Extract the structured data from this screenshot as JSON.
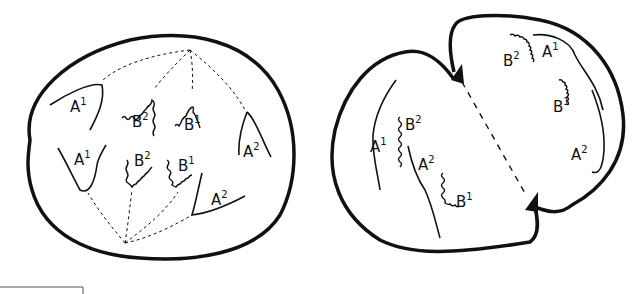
{
  "diagram": {
    "left_cell": {
      "stage": "metaphase",
      "labels": [
        {
          "id": "a1-top",
          "base": "A",
          "sup": "1",
          "x": 70,
          "y": 112
        },
        {
          "id": "b2-top",
          "base": "B",
          "sup": "2",
          "x": 132,
          "y": 127
        },
        {
          "id": "b1-top",
          "base": "B",
          "sup": "1",
          "x": 184,
          "y": 130
        },
        {
          "id": "a2-right",
          "base": "A",
          "sup": "2",
          "x": 243,
          "y": 157
        },
        {
          "id": "a1-bottom",
          "base": "A",
          "sup": "1",
          "x": 74,
          "y": 165
        },
        {
          "id": "b2-bottom",
          "base": "B",
          "sup": "2",
          "x": 134,
          "y": 166
        },
        {
          "id": "b1-bottom",
          "base": "B",
          "sup": "1",
          "x": 178,
          "y": 171
        },
        {
          "id": "a2-bottom",
          "base": "A",
          "sup": "2",
          "x": 211,
          "y": 205
        }
      ]
    },
    "right_cell": {
      "stage": "cytokinesis",
      "labels": [
        {
          "id": "b2-upper",
          "base": "B",
          "sup": "2",
          "x": 503,
          "y": 66
        },
        {
          "id": "a1-upper",
          "base": "A",
          "sup": "1",
          "x": 542,
          "y": 57
        },
        {
          "id": "b1-upper",
          "base": "B",
          "sup": "1",
          "x": 553,
          "y": 112
        },
        {
          "id": "a2-upper",
          "base": "A",
          "sup": "2",
          "x": 571,
          "y": 160
        },
        {
          "id": "b2-lower",
          "base": "B",
          "sup": "2",
          "x": 405,
          "y": 130
        },
        {
          "id": "a1-lower",
          "base": "A",
          "sup": "1",
          "x": 370,
          "y": 152
        },
        {
          "id": "a2-lower",
          "base": "A",
          "sup": "2",
          "x": 418,
          "y": 170
        },
        {
          "id": "b1-lower",
          "base": "B",
          "sup": "1",
          "x": 456,
          "y": 207
        }
      ]
    },
    "colors": {
      "stroke": "#111111",
      "background": "#ffffff"
    }
  }
}
